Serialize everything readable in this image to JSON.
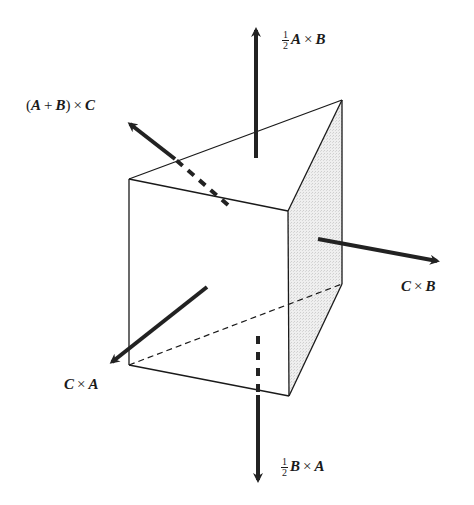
{
  "figure": {
    "colors": {
      "stroke": "#1a1a1a",
      "arrow": "#222222",
      "shaded_face": "#e6e6e6",
      "background": "#ffffff"
    },
    "vertices": {
      "top_front_left": [
        129,
        179
      ],
      "top_front_right": [
        288,
        211
      ],
      "top_back": [
        342,
        100
      ],
      "bottom_front_left": [
        129,
        365
      ],
      "bottom_front_right": [
        289,
        396
      ],
      "bottom_back": [
        342,
        284
      ]
    }
  },
  "labels": {
    "top": {
      "frac_num": "1",
      "frac_den": "2",
      "a": "A",
      "op": "×",
      "b": "B"
    },
    "upper_left": {
      "open": "(",
      "a": "A",
      "plus": "+",
      "b": "B",
      "close": ")",
      "op": "×",
      "c": "C"
    },
    "right": {
      "a": "C",
      "op": "×",
      "b": "B"
    },
    "lower_left": {
      "a": "C",
      "op": "×",
      "b": "A"
    },
    "bottom": {
      "frac_num": "1",
      "frac_den": "2",
      "a": "B",
      "op": "×",
      "b": "A"
    }
  }
}
